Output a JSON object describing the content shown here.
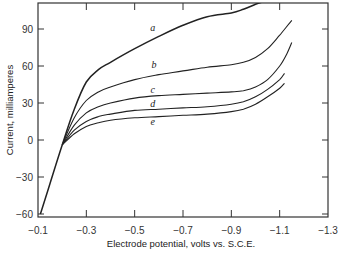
{
  "chart_data": {
    "type": "line",
    "title": "",
    "xlabel": "Electrode potential, volts vs. S.C.E.",
    "ylabel": "Current, milliamperes",
    "xlim": [
      -0.1,
      -1.3
    ],
    "ylim": [
      -62,
      112
    ],
    "x_ticks": [
      -0.1,
      -0.3,
      -0.5,
      -0.7,
      -0.9,
      -1.1,
      -1.3
    ],
    "x_tick_labels": [
      "−0.1",
      "−0.3",
      "−0.5",
      "−0.7",
      "−0.9",
      "−1.1",
      "−1.3"
    ],
    "y_ticks": [
      90,
      60,
      30,
      0,
      -30,
      -60
    ],
    "y_tick_labels": [
      "90",
      "60",
      "30",
      "0",
      "−30",
      "−60"
    ],
    "grid": false,
    "legend": "inline labels",
    "series": [
      {
        "name": "a",
        "x": [
          -0.11,
          -0.15,
          -0.2,
          -0.25,
          -0.3,
          -0.35,
          -0.4,
          -0.5,
          -0.6,
          -0.7,
          -0.8,
          -0.9,
          -0.95,
          -1.0,
          -1.03
        ],
        "y": [
          -60,
          -35,
          -4,
          25,
          47,
          57,
          63,
          74,
          84,
          93,
          100,
          103,
          106,
          110,
          112
        ],
        "label_pos": [
          -0.575,
          88
        ]
      },
      {
        "name": "b",
        "x": [
          -0.2,
          -0.25,
          -0.3,
          -0.35,
          -0.4,
          -0.5,
          -0.6,
          -0.7,
          -0.8,
          -0.9,
          -0.95,
          -1.0,
          -1.05,
          -1.1,
          -1.15
        ],
        "y": [
          -4,
          18,
          32,
          39,
          43,
          49,
          53,
          56,
          59,
          61,
          63,
          67,
          74,
          85,
          97
        ],
        "label_pos": [
          -0.58,
          58
        ]
      },
      {
        "name": "c",
        "x": [
          -0.2,
          -0.25,
          -0.3,
          -0.35,
          -0.4,
          -0.5,
          -0.6,
          -0.7,
          -0.8,
          -0.9,
          -0.95,
          -1.0,
          -1.05,
          -1.1,
          -1.13,
          -1.15
        ],
        "y": [
          -4,
          12,
          22,
          27,
          30,
          34,
          36,
          37,
          38,
          39,
          40,
          43,
          49,
          60,
          70,
          79
        ],
        "label_pos": [
          -0.575,
          38
        ]
      },
      {
        "name": "d",
        "x": [
          -0.2,
          -0.25,
          -0.3,
          -0.35,
          -0.4,
          -0.5,
          -0.6,
          -0.7,
          -0.8,
          -0.9,
          -0.95,
          -1.0,
          -1.05,
          -1.1,
          -1.12
        ],
        "y": [
          -4,
          8,
          15,
          19,
          21,
          24,
          25,
          26,
          27,
          29,
          31,
          35,
          41,
          49,
          54
        ],
        "label_pos": [
          -0.575,
          27
        ]
      },
      {
        "name": "e",
        "x": [
          -0.2,
          -0.25,
          -0.3,
          -0.35,
          -0.4,
          -0.5,
          -0.6,
          -0.7,
          -0.8,
          -0.9,
          -0.95,
          -1.0,
          -1.05,
          -1.1,
          -1.12
        ],
        "y": [
          -4,
          5,
          11,
          14,
          16,
          18,
          19,
          20,
          21,
          23,
          25,
          29,
          35,
          42,
          46
        ],
        "label_pos": [
          -0.575,
          12
        ]
      }
    ]
  }
}
